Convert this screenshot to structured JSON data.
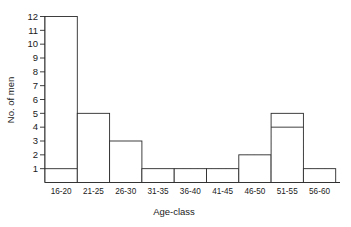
{
  "chart_data": {
    "type": "bar",
    "title": "",
    "subtitle": "",
    "xlabel": "Age-class",
    "ylabel": "No. of men",
    "categories": [
      "16-20",
      "21-25",
      "26-30",
      "31-35",
      "36-40",
      "41-45",
      "46-50",
      "51-55",
      "56-60"
    ],
    "values": [
      12,
      5,
      3,
      1,
      1,
      1,
      2,
      5,
      1
    ],
    "series": [
      {
        "name": "shaded-portion",
        "values": [
          1,
          0,
          0,
          0,
          1,
          1,
          2,
          4,
          1
        ]
      },
      {
        "name": "unshaded-portion",
        "values": [
          11,
          5,
          3,
          1,
          0,
          0,
          0,
          1,
          0
        ]
      }
    ],
    "ylim": [
      0,
      12
    ],
    "yticks": [
      1,
      2,
      3,
      4,
      5,
      6,
      7,
      8,
      9,
      10,
      11,
      12
    ],
    "ytick_labels": [
      "1",
      "2",
      "3",
      "4",
      "5",
      "6",
      "7",
      "8",
      "9",
      "10",
      "11",
      "12"
    ],
    "grid": false,
    "legend": false,
    "legend_position": "none",
    "bar_gap": 0,
    "colors": {
      "axis": "#2b2b2b",
      "bar_fill": "#ffffff",
      "bar_stroke": "#2b2b2b",
      "hatch": "#2b2b2b",
      "background": "#ffffff",
      "text": "#1a1a1a"
    }
  }
}
